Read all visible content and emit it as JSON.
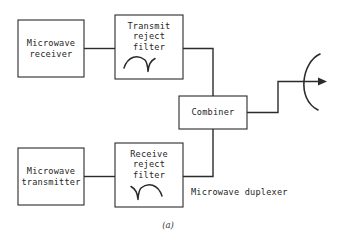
{
  "figure": {
    "label": "(a)",
    "caption": "Microwave duplexer"
  },
  "blocks": {
    "receiver": {
      "line1": "Microwave",
      "line2": "receiver"
    },
    "transmit_reject_filter": {
      "line1": "Transmit",
      "line2": "reject",
      "line3": "filter",
      "response_icon": "band-reject-notch-right"
    },
    "transmitter": {
      "line1": "Microwave",
      "line2": "transmitter"
    },
    "receive_reject_filter": {
      "line1": "Receive",
      "line2": "reject",
      "line3": "filter",
      "response_icon": "band-reject-notch-left"
    },
    "combiner": {
      "label": "Combiner"
    }
  },
  "antenna": {
    "name": "parabolic-dish-antenna",
    "feed_icon": "feed-arrow-right"
  },
  "colors": {
    "stroke": "#2b2b2b",
    "text": "#262626",
    "background": "#ffffff"
  }
}
